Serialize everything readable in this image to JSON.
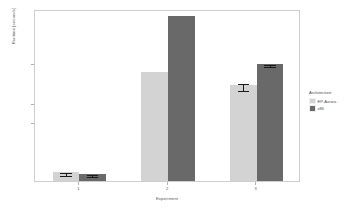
{
  "chart_data": {
    "type": "bar",
    "title": "",
    "subtitle": "",
    "xlabel": "Experiment",
    "ylabel": "Runtime [seconds]",
    "categories": [
      "1",
      "2",
      "3"
    ],
    "series": [
      {
        "name": "EP-Aurora",
        "color": "#d3d3d3",
        "values": [
          220,
          2800,
          2450
        ],
        "errors": [
          30,
          0,
          90
        ]
      },
      {
        "name": "x86",
        "color": "#696969",
        "values": [
          185,
          4230,
          3000
        ],
        "errors": [
          25,
          0,
          25
        ]
      }
    ],
    "ylim": [
      0,
      4400
    ],
    "yticks": [
      1500,
      2000,
      3000
    ],
    "yticklabels": [
      "1500",
      "2000",
      "3000"
    ],
    "xticklabels": [
      "1",
      "2",
      "3"
    ],
    "grid": false,
    "legend": {
      "title": "Architecture",
      "position": "right",
      "entries": [
        {
          "label": "EP-Aurora",
          "color": "#d3d3d3"
        },
        {
          "label": "x86",
          "color": "#696969"
        }
      ]
    },
    "panel": {
      "background": "#ffffff",
      "border_color": "#cfcfcf"
    }
  }
}
